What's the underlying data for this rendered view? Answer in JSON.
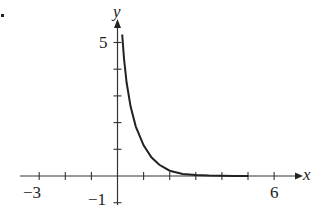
{
  "chart_data": {
    "type": "line",
    "title": "",
    "xlabel": "x",
    "ylabel": "y",
    "xlim": [
      -3.2,
      6.9
    ],
    "ylim": [
      -1.1,
      5.9
    ],
    "x_tick_labels": [
      "-3",
      "6"
    ],
    "y_tick_labels": [
      "5",
      "-1"
    ],
    "x_ticks": [
      -3,
      -2,
      -1,
      0,
      1,
      2,
      3,
      4,
      5,
      6
    ],
    "y_ticks": [
      -1,
      1,
      2,
      3,
      4,
      5
    ],
    "grid": false,
    "legend": null,
    "series": [
      {
        "name": "curve",
        "x": [
          0.18,
          0.25,
          0.35,
          0.5,
          0.7,
          1.0,
          1.3,
          1.6,
          2.0,
          2.5,
          3.0,
          3.5,
          4.0,
          4.5,
          5.0
        ],
        "y": [
          5.3,
          4.4,
          3.5,
          2.6,
          1.85,
          1.15,
          0.7,
          0.42,
          0.2,
          0.08,
          0.04,
          0.02,
          0.01,
          0.005,
          0.0
        ]
      }
    ]
  },
  "labels": {
    "x_axis": "x",
    "y_axis": "y",
    "x_min_tick": "−3",
    "x_max_tick": "6",
    "y_max_tick": "5",
    "y_min_tick": "−1"
  }
}
